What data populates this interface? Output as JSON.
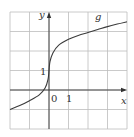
{
  "chart_data": {
    "type": "line",
    "title": "",
    "xlabel": "x",
    "ylabel": "y",
    "xlim": [
      -2,
      4
    ],
    "ylim": [
      -2,
      4
    ],
    "grid": true,
    "grid_step": 1,
    "tick_labels": {
      "origin": "0",
      "x": "1",
      "y": "1"
    },
    "series": [
      {
        "name": "g",
        "x": [
          -2,
          -1.5,
          -1,
          -0.5,
          -0.2,
          -0.05,
          0,
          0.05,
          0.2,
          0.5,
          1,
          1.5,
          2,
          2.5,
          3,
          3.5,
          4
        ],
        "y": [
          -1.0,
          -0.8,
          -0.55,
          -0.25,
          0.1,
          0.55,
          1.0,
          1.45,
          1.9,
          2.3,
          2.6,
          2.8,
          2.95,
          3.1,
          3.25,
          3.38,
          3.5
        ]
      }
    ],
    "legend": [],
    "annotations": [
      {
        "text": "g",
        "x": 2.5,
        "y": 3.85
      }
    ]
  },
  "colors": {
    "grid": "#bdbdbd",
    "axis": "#333333",
    "curve": "#3a3a3a"
  },
  "labels": {
    "x_axis": "x",
    "y_axis": "y",
    "origin": "0",
    "x_tick_1": "1",
    "y_tick_1": "1",
    "curve_name": "g"
  }
}
